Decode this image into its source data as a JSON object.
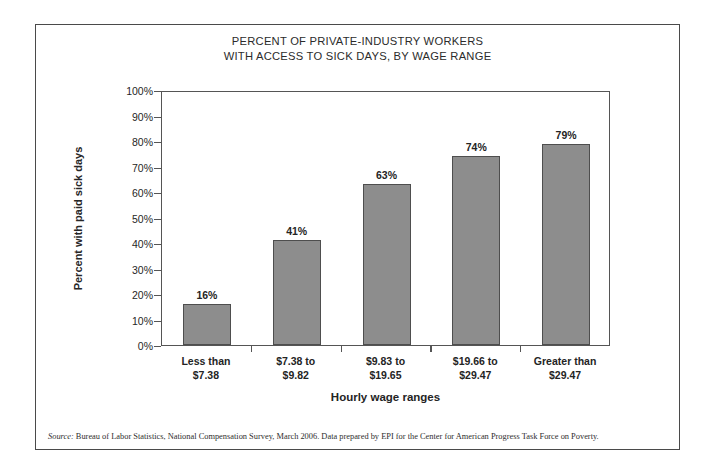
{
  "title": {
    "line1": "PERCENT OF PRIVATE-INDUSTRY WORKERS",
    "line2": "WITH ACCESS TO SICK DAYS, BY WAGE RANGE"
  },
  "axes": {
    "y_title": "Percent with paid sick days",
    "x_title": "Hourly wage ranges"
  },
  "source": {
    "label": "Source:",
    "text": " Bureau of Labor Statistics, National Compensation Survey, March 2006. Data prepared by EPI for the Center for American Progress Task Force on Poverty."
  },
  "style": {
    "bar_fill": "#8d8d8d",
    "bar_stroke": "#4e4e4e",
    "axis_color": "#555555",
    "frame_color": "#4a4a4a",
    "text_color": "#242424"
  },
  "chart_data": {
    "type": "bar",
    "title": "PERCENT OF PRIVATE-INDUSTRY WORKERS WITH ACCESS TO SICK DAYS, BY WAGE RANGE",
    "xlabel": "Hourly wage ranges",
    "ylabel": "Percent with paid sick days",
    "ylim": [
      0,
      100
    ],
    "ytick_labels": [
      "0%",
      "10%",
      "20%",
      "30%",
      "40%",
      "50%",
      "60%",
      "70%",
      "80%",
      "90%",
      "100%"
    ],
    "ytick_values": [
      0,
      10,
      20,
      30,
      40,
      50,
      60,
      70,
      80,
      90,
      100
    ],
    "grid": false,
    "legend": false,
    "categories": [
      "Less than $7.38",
      "$7.38 to $9.82",
      "$9.83 to $19.65",
      "$19.66 to $29.47",
      "Greater than $29.47"
    ],
    "category_lines": [
      [
        "Less than",
        "$7.38"
      ],
      [
        "$7.38 to",
        "$9.82"
      ],
      [
        "$9.83 to",
        "$19.65"
      ],
      [
        "$19.66 to",
        "$29.47"
      ],
      [
        "Greater than",
        "$29.47"
      ]
    ],
    "values": [
      16,
      41,
      63,
      74,
      79
    ],
    "value_labels": [
      "16%",
      "41%",
      "63%",
      "74%",
      "79%"
    ]
  }
}
